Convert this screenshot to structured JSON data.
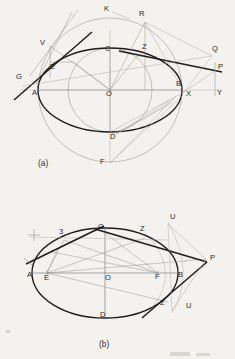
{
  "sheet": {
    "background_color": "#f3f2ee",
    "ink_color": "#1f1e1d",
    "construction_color": "#a9a7a3"
  },
  "figures": [
    {
      "id": "figure-a",
      "caption": "(a)",
      "description": "Ellipse construction with auxiliary circles, tangents and directrix-type construction lines",
      "labels": [
        {
          "text": "K",
          "x": 104,
          "y": 11
        },
        {
          "text": "R",
          "x": 139,
          "y": 16
        },
        {
          "text": "V",
          "x": 40,
          "y": 45
        },
        {
          "text": "C",
          "x": 105,
          "y": 51
        },
        {
          "text": "Z",
          "x": 142,
          "y": 49
        },
        {
          "text": "Q",
          "x": 212,
          "y": 51
        },
        {
          "text": "E",
          "x": 50,
          "y": 69
        },
        {
          "text": "P",
          "x": 218,
          "y": 69
        },
        {
          "text": "G",
          "x": 16,
          "y": 79
        },
        {
          "text": "B",
          "x": 176,
          "y": 86
        },
        {
          "text": "A",
          "x": 32,
          "y": 95
        },
        {
          "text": "O",
          "x": 106,
          "y": 96
        },
        {
          "text": "X",
          "x": 186,
          "y": 96
        },
        {
          "text": "Y",
          "x": 217,
          "y": 95
        },
        {
          "text": "D",
          "x": 110,
          "y": 139
        },
        {
          "text": "F",
          "x": 100,
          "y": 164
        }
      ]
    },
    {
      "id": "figure-b",
      "caption": "(b)",
      "description": "Ellipse with foci E and F, tangent construction through points S, Z and external point P",
      "labels": [
        {
          "text": "U",
          "x": 170,
          "y": 219
        },
        {
          "text": "C",
          "x": 98,
          "y": 229
        },
        {
          "text": "3",
          "x": 59,
          "y": 234
        },
        {
          "text": "Z",
          "x": 140,
          "y": 231
        },
        {
          "text": "P",
          "x": 210,
          "y": 260
        },
        {
          "text": "A",
          "x": 27,
          "y": 277
        },
        {
          "text": "E",
          "x": 44,
          "y": 280
        },
        {
          "text": "O",
          "x": 105,
          "y": 280
        },
        {
          "text": "F",
          "x": 155,
          "y": 279
        },
        {
          "text": "B",
          "x": 178,
          "y": 277
        },
        {
          "text": "Z",
          "x": 160,
          "y": 305
        },
        {
          "text": "U",
          "x": 186,
          "y": 308
        },
        {
          "text": "D",
          "x": 100,
          "y": 317
        }
      ]
    }
  ]
}
